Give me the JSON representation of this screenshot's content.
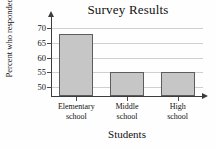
{
  "chart_data": {
    "type": "bar",
    "title": "Survey Results",
    "xlabel": "Students",
    "ylabel": "Percent who responded \"no\"",
    "ylabel_line1": "Percent who",
    "ylabel_line2": "responded \"no\"",
    "categories": [
      "Elementary school",
      "Middle school",
      "High school"
    ],
    "category_lines": [
      {
        "line1": "Elementary",
        "line2": "school"
      },
      {
        "line1": "Middle",
        "line2": "school"
      },
      {
        "line1": "High",
        "line2": "school"
      }
    ],
    "values": [
      68,
      55,
      55
    ],
    "ylim": [
      47,
      72
    ],
    "yticks": [
      50,
      55,
      60,
      65,
      70
    ],
    "ytick_labels": [
      "50",
      "55",
      "60",
      "65",
      "70"
    ],
    "grid": true,
    "legend": "none",
    "bar_fill_color": "#c6c6c6",
    "bar_border_color": "#5d5d5d",
    "axis_color": "#3c3c3c",
    "grid_color": "#cfcfcf",
    "background_color": "#fefefe"
  }
}
